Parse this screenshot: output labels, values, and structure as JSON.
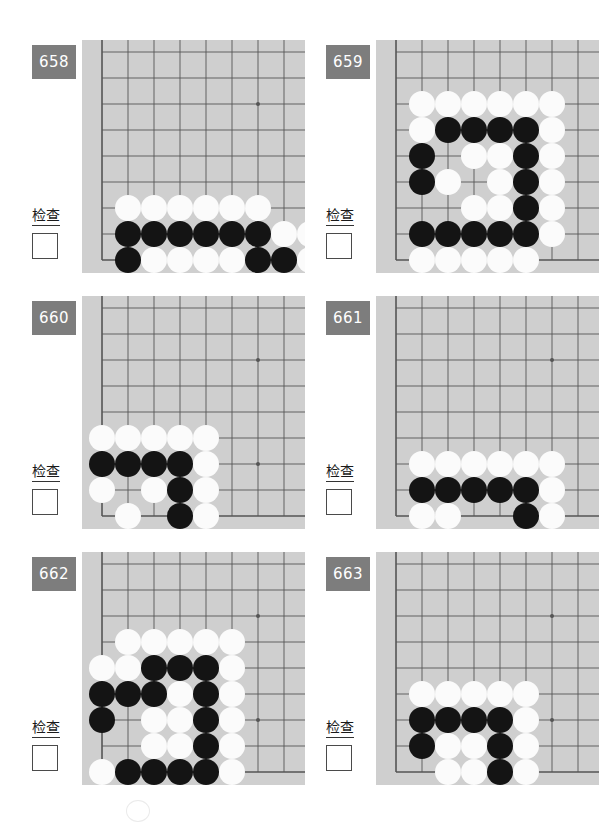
{
  "page": {
    "background": "#ffffff",
    "width": 616,
    "height": 820,
    "board_color": "#cfcfcf",
    "grid_color": "#555555",
    "badge_color": "#7d7d7d",
    "black_stone_color": "#141414",
    "white_stone_color": "#fbfbfb"
  },
  "labels": {
    "check_text": "检查"
  },
  "board_spec": {
    "cols": 8,
    "rows": 8,
    "cell": 26,
    "origin_x": 20,
    "origin_y": 12,
    "stone_diameter": 26,
    "star_points": [
      [
        6,
        2
      ],
      [
        6,
        6
      ]
    ],
    "edge_left_col": 0,
    "edge_bottom_row": 8,
    "note": "Grid columns indexed 0-8 left to right; rows 0-8 top to bottom. The board shows a corner: column 0 is the left board edge line and row 8 is the bottom board edge line."
  },
  "puzzles": [
    {
      "number": "658",
      "position": {
        "left": 26,
        "top": 36
      },
      "stones": [
        {
          "c": 1,
          "r": 6,
          "color": "w"
        },
        {
          "c": 2,
          "r": 6,
          "color": "w"
        },
        {
          "c": 3,
          "r": 6,
          "color": "w"
        },
        {
          "c": 4,
          "r": 6,
          "color": "w"
        },
        {
          "c": 5,
          "r": 6,
          "color": "w"
        },
        {
          "c": 6,
          "r": 6,
          "color": "w"
        },
        {
          "c": 1,
          "r": 7,
          "color": "b"
        },
        {
          "c": 2,
          "r": 7,
          "color": "b"
        },
        {
          "c": 3,
          "r": 7,
          "color": "b"
        },
        {
          "c": 4,
          "r": 7,
          "color": "b"
        },
        {
          "c": 5,
          "r": 7,
          "color": "b"
        },
        {
          "c": 6,
          "r": 7,
          "color": "b"
        },
        {
          "c": 7,
          "r": 7,
          "color": "w"
        },
        {
          "c": 8,
          "r": 7,
          "color": "w"
        },
        {
          "c": 1,
          "r": 8,
          "color": "b"
        },
        {
          "c": 2,
          "r": 8,
          "color": "w"
        },
        {
          "c": 3,
          "r": 8,
          "color": "w"
        },
        {
          "c": 4,
          "r": 8,
          "color": "w"
        },
        {
          "c": 5,
          "r": 8,
          "color": "w"
        },
        {
          "c": 6,
          "r": 8,
          "color": "b"
        },
        {
          "c": 7,
          "r": 8,
          "color": "b"
        },
        {
          "c": 8,
          "r": 8,
          "color": "w"
        },
        {
          "c": 3,
          "r": 9,
          "color": "b"
        },
        {
          "c": 5,
          "r": 9,
          "color": "w"
        },
        {
          "c": 7,
          "r": 9,
          "color": "b"
        },
        {
          "c": 8,
          "r": 9,
          "color": "w"
        }
      ]
    },
    {
      "number": "659",
      "position": {
        "left": 320,
        "top": 36
      },
      "stones": [
        {
          "c": 1,
          "r": 2,
          "color": "w"
        },
        {
          "c": 2,
          "r": 2,
          "color": "w"
        },
        {
          "c": 3,
          "r": 2,
          "color": "w"
        },
        {
          "c": 4,
          "r": 2,
          "color": "w"
        },
        {
          "c": 5,
          "r": 2,
          "color": "w"
        },
        {
          "c": 6,
          "r": 2,
          "color": "w"
        },
        {
          "c": 1,
          "r": 3,
          "color": "w"
        },
        {
          "c": 2,
          "r": 3,
          "color": "b"
        },
        {
          "c": 3,
          "r": 3,
          "color": "b"
        },
        {
          "c": 4,
          "r": 3,
          "color": "b"
        },
        {
          "c": 5,
          "r": 3,
          "color": "b"
        },
        {
          "c": 6,
          "r": 3,
          "color": "w"
        },
        {
          "c": 1,
          "r": 4,
          "color": "b"
        },
        {
          "c": 3,
          "r": 4,
          "color": "w"
        },
        {
          "c": 4,
          "r": 4,
          "color": "w"
        },
        {
          "c": 5,
          "r": 4,
          "color": "b"
        },
        {
          "c": 6,
          "r": 4,
          "color": "w"
        },
        {
          "c": 1,
          "r": 5,
          "color": "b"
        },
        {
          "c": 2,
          "r": 5,
          "color": "w"
        },
        {
          "c": 4,
          "r": 5,
          "color": "w"
        },
        {
          "c": 5,
          "r": 5,
          "color": "b"
        },
        {
          "c": 6,
          "r": 5,
          "color": "w"
        },
        {
          "c": 3,
          "r": 6,
          "color": "w"
        },
        {
          "c": 4,
          "r": 6,
          "color": "w"
        },
        {
          "c": 5,
          "r": 6,
          "color": "b"
        },
        {
          "c": 6,
          "r": 6,
          "color": "w"
        },
        {
          "c": 1,
          "r": 7,
          "color": "b"
        },
        {
          "c": 2,
          "r": 7,
          "color": "b"
        },
        {
          "c": 3,
          "r": 7,
          "color": "b"
        },
        {
          "c": 4,
          "r": 7,
          "color": "b"
        },
        {
          "c": 5,
          "r": 7,
          "color": "b"
        },
        {
          "c": 6,
          "r": 7,
          "color": "w"
        },
        {
          "c": 1,
          "r": 8,
          "color": "w"
        },
        {
          "c": 2,
          "r": 8,
          "color": "w"
        },
        {
          "c": 3,
          "r": 8,
          "color": "w"
        },
        {
          "c": 4,
          "r": 8,
          "color": "w"
        },
        {
          "c": 5,
          "r": 8,
          "color": "w"
        }
      ]
    },
    {
      "number": "660",
      "position": {
        "left": 26,
        "top": 292
      },
      "stones": [
        {
          "c": 0,
          "r": 5,
          "color": "w"
        },
        {
          "c": 1,
          "r": 5,
          "color": "w"
        },
        {
          "c": 2,
          "r": 5,
          "color": "w"
        },
        {
          "c": 3,
          "r": 5,
          "color": "w"
        },
        {
          "c": 4,
          "r": 5,
          "color": "w"
        },
        {
          "c": 0,
          "r": 6,
          "color": "b"
        },
        {
          "c": 1,
          "r": 6,
          "color": "b"
        },
        {
          "c": 2,
          "r": 6,
          "color": "b"
        },
        {
          "c": 3,
          "r": 6,
          "color": "b"
        },
        {
          "c": 4,
          "r": 6,
          "color": "w"
        },
        {
          "c": 0,
          "r": 7,
          "color": "w"
        },
        {
          "c": 2,
          "r": 7,
          "color": "w"
        },
        {
          "c": 3,
          "r": 7,
          "color": "b"
        },
        {
          "c": 4,
          "r": 7,
          "color": "w"
        },
        {
          "c": 1,
          "r": 8,
          "color": "w"
        },
        {
          "c": 3,
          "r": 8,
          "color": "b"
        },
        {
          "c": 4,
          "r": 8,
          "color": "w"
        },
        {
          "c": 0,
          "r": 9,
          "color": "b"
        },
        {
          "c": 1,
          "r": 9,
          "color": "w"
        },
        {
          "c": 3,
          "r": 9,
          "color": "b"
        },
        {
          "c": 4,
          "r": 9,
          "color": "w"
        }
      ]
    },
    {
      "number": "661",
      "position": {
        "left": 320,
        "top": 292
      },
      "stones": [
        {
          "c": 1,
          "r": 6,
          "color": "w"
        },
        {
          "c": 2,
          "r": 6,
          "color": "w"
        },
        {
          "c": 3,
          "r": 6,
          "color": "w"
        },
        {
          "c": 4,
          "r": 6,
          "color": "w"
        },
        {
          "c": 5,
          "r": 6,
          "color": "w"
        },
        {
          "c": 6,
          "r": 6,
          "color": "w"
        },
        {
          "c": 1,
          "r": 7,
          "color": "b"
        },
        {
          "c": 2,
          "r": 7,
          "color": "b"
        },
        {
          "c": 3,
          "r": 7,
          "color": "b"
        },
        {
          "c": 4,
          "r": 7,
          "color": "b"
        },
        {
          "c": 5,
          "r": 7,
          "color": "b"
        },
        {
          "c": 6,
          "r": 7,
          "color": "w"
        },
        {
          "c": 1,
          "r": 8,
          "color": "w"
        },
        {
          "c": 2,
          "r": 8,
          "color": "w"
        },
        {
          "c": 5,
          "r": 8,
          "color": "b"
        },
        {
          "c": 6,
          "r": 8,
          "color": "w"
        },
        {
          "c": 2,
          "r": 9,
          "color": "w"
        },
        {
          "c": 3,
          "r": 9,
          "color": "b"
        },
        {
          "c": 4,
          "r": 9,
          "color": "w"
        },
        {
          "c": 5,
          "r": 9,
          "color": "b"
        },
        {
          "c": 6,
          "r": 9,
          "color": "w"
        }
      ]
    },
    {
      "number": "662",
      "position": {
        "left": 26,
        "top": 548
      },
      "stones": [
        {
          "c": 1,
          "r": 3,
          "color": "w"
        },
        {
          "c": 2,
          "r": 3,
          "color": "w"
        },
        {
          "c": 3,
          "r": 3,
          "color": "w"
        },
        {
          "c": 4,
          "r": 3,
          "color": "w"
        },
        {
          "c": 5,
          "r": 3,
          "color": "w"
        },
        {
          "c": 0,
          "r": 4,
          "color": "w"
        },
        {
          "c": 1,
          "r": 4,
          "color": "w"
        },
        {
          "c": 2,
          "r": 4,
          "color": "b"
        },
        {
          "c": 3,
          "r": 4,
          "color": "b"
        },
        {
          "c": 4,
          "r": 4,
          "color": "b"
        },
        {
          "c": 5,
          "r": 4,
          "color": "w"
        },
        {
          "c": 0,
          "r": 5,
          "color": "b"
        },
        {
          "c": 1,
          "r": 5,
          "color": "b"
        },
        {
          "c": 2,
          "r": 5,
          "color": "b"
        },
        {
          "c": 3,
          "r": 5,
          "color": "w"
        },
        {
          "c": 4,
          "r": 5,
          "color": "b"
        },
        {
          "c": 5,
          "r": 5,
          "color": "w"
        },
        {
          "c": 0,
          "r": 6,
          "color": "b"
        },
        {
          "c": 2,
          "r": 6,
          "color": "w"
        },
        {
          "c": 3,
          "r": 6,
          "color": "w"
        },
        {
          "c": 4,
          "r": 6,
          "color": "b"
        },
        {
          "c": 5,
          "r": 6,
          "color": "w"
        },
        {
          "c": 2,
          "r": 7,
          "color": "w"
        },
        {
          "c": 3,
          "r": 7,
          "color": "w"
        },
        {
          "c": 4,
          "r": 7,
          "color": "b"
        },
        {
          "c": 5,
          "r": 7,
          "color": "w"
        },
        {
          "c": 0,
          "r": 8,
          "color": "w"
        },
        {
          "c": 1,
          "r": 8,
          "color": "b"
        },
        {
          "c": 2,
          "r": 8,
          "color": "b"
        },
        {
          "c": 3,
          "r": 8,
          "color": "b"
        },
        {
          "c": 4,
          "r": 8,
          "color": "b"
        },
        {
          "c": 5,
          "r": 8,
          "color": "w"
        },
        {
          "c": 0,
          "r": 9,
          "color": "w"
        },
        {
          "c": 1,
          "r": 9,
          "color": "w"
        },
        {
          "c": 2,
          "r": 9,
          "color": "w"
        },
        {
          "c": 3,
          "r": 9,
          "color": "w"
        },
        {
          "c": 4,
          "r": 9,
          "color": "w"
        },
        {
          "c": 5,
          "r": 9,
          "color": "w"
        }
      ]
    },
    {
      "number": "663",
      "position": {
        "left": 320,
        "top": 548
      },
      "stones": [
        {
          "c": 1,
          "r": 5,
          "color": "w"
        },
        {
          "c": 2,
          "r": 5,
          "color": "w"
        },
        {
          "c": 3,
          "r": 5,
          "color": "w"
        },
        {
          "c": 4,
          "r": 5,
          "color": "w"
        },
        {
          "c": 5,
          "r": 5,
          "color": "w"
        },
        {
          "c": 1,
          "r": 6,
          "color": "b"
        },
        {
          "c": 2,
          "r": 6,
          "color": "b"
        },
        {
          "c": 3,
          "r": 6,
          "color": "b"
        },
        {
          "c": 4,
          "r": 6,
          "color": "b"
        },
        {
          "c": 5,
          "r": 6,
          "color": "w"
        },
        {
          "c": 1,
          "r": 7,
          "color": "b"
        },
        {
          "c": 2,
          "r": 7,
          "color": "w"
        },
        {
          "c": 3,
          "r": 7,
          "color": "w"
        },
        {
          "c": 4,
          "r": 7,
          "color": "b"
        },
        {
          "c": 5,
          "r": 7,
          "color": "w"
        },
        {
          "c": 2,
          "r": 8,
          "color": "w"
        },
        {
          "c": 3,
          "r": 8,
          "color": "w"
        },
        {
          "c": 4,
          "r": 8,
          "color": "b"
        },
        {
          "c": 5,
          "r": 8,
          "color": "w"
        },
        {
          "c": 1,
          "r": 9,
          "color": "w"
        },
        {
          "c": 4,
          "r": 9,
          "color": "b"
        },
        {
          "c": 5,
          "r": 9,
          "color": "w"
        }
      ]
    }
  ]
}
